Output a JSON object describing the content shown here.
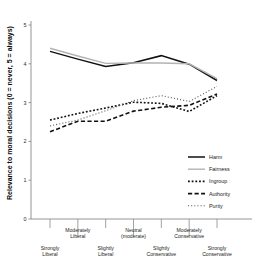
{
  "chart_data": {
    "type": "line",
    "title": "",
    "xlabel": "",
    "ylabel": "Relevance to moral decisions  (0 = never, 5 = always)",
    "ylim": [
      0,
      5
    ],
    "yticks": [
      0,
      1,
      2,
      3,
      4,
      5
    ],
    "ytick_labels": [
      "0",
      "1",
      "2",
      "3",
      "4",
      "5"
    ],
    "grid": false,
    "legend_position": "center-right",
    "categories": [
      "Strongly Liberal",
      "Moderately Liberal",
      "Slightly Liberal",
      "Neutral (moderate)",
      "Slightly Conservative",
      "Moderately Conservative",
      "Strongly Conservative"
    ],
    "category_lines": [
      [
        "Strongly",
        "Liberal"
      ],
      [
        "Moderately",
        "Liberal"
      ],
      [
        "Slightly",
        "Liberal"
      ],
      [
        "Neutral",
        "(moderate)"
      ],
      [
        "Slightly",
        "Conservative"
      ],
      [
        "Moderately",
        "Conservative"
      ],
      [
        "Strongly",
        "Conservative"
      ]
    ],
    "category_row": [
      1,
      0,
      1,
      0,
      1,
      0,
      1
    ],
    "series": [
      {
        "name": "Harm",
        "color": "#111111",
        "style": "solid",
        "width": 1.5,
        "values": [
          4.32,
          4.12,
          3.93,
          4.03,
          4.21,
          3.99,
          3.57
        ]
      },
      {
        "name": "Fairness",
        "color": "#b3b3b3",
        "style": "solid",
        "width": 1.4,
        "values": [
          4.4,
          4.2,
          4.01,
          4.02,
          4.02,
          4.0,
          3.62
        ]
      },
      {
        "name": "Ingroup",
        "color": "#111111",
        "style": "dotted",
        "width": 1.6,
        "values": [
          2.55,
          2.72,
          2.86,
          3.01,
          2.98,
          2.77,
          3.18
        ]
      },
      {
        "name": "Authority",
        "color": "#111111",
        "style": "dashed",
        "width": 1.6,
        "values": [
          2.25,
          2.52,
          2.52,
          2.78,
          2.88,
          2.93,
          3.22
        ]
      },
      {
        "name": "Purity",
        "color": "#5a5a5a",
        "style": "fine-dotted",
        "width": 1.1,
        "values": [
          2.4,
          2.55,
          2.79,
          3.05,
          3.18,
          3.03,
          3.42
        ]
      }
    ]
  },
  "legend": {
    "items": [
      {
        "label": "Harm"
      },
      {
        "label": "Fairness"
      },
      {
        "label": "Ingroup"
      },
      {
        "label": "Authority"
      },
      {
        "label": "Purity"
      }
    ]
  }
}
